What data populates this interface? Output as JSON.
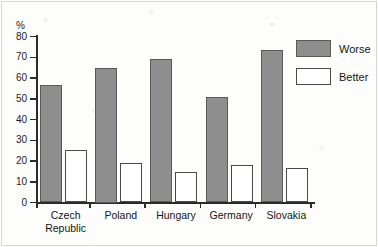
{
  "chart_data": {
    "type": "bar",
    "title": "",
    "subtitle": "",
    "xlabel": "",
    "ylabel": "%",
    "ylim": [
      0,
      80
    ],
    "ytick_labels": [
      "0",
      "10",
      "20",
      "30",
      "40",
      "50",
      "60",
      "70",
      "80"
    ],
    "ytick_values": [
      0,
      10,
      20,
      30,
      40,
      50,
      60,
      70,
      80
    ],
    "grid": false,
    "legend_position": "right-top",
    "categories": [
      "Czech Republic",
      "Poland",
      "Hungary",
      "Germany",
      "Slovakia"
    ],
    "category_lines": [
      [
        "Czech",
        "Republic"
      ],
      [
        "Poland"
      ],
      [
        "Hungary"
      ],
      [
        "Germany"
      ],
      [
        "Slovakia"
      ]
    ],
    "series": [
      {
        "name": "Worse",
        "color": "#8e8e8e",
        "border_color": "#5a5a5a",
        "values": [
          56.5,
          65,
          69,
          51,
          73.5
        ]
      },
      {
        "name": "Better",
        "color": "#ffffff",
        "border_color": "#4a4a4a",
        "values": [
          25.5,
          19,
          14.5,
          18,
          16.5
        ]
      }
    ]
  },
  "axis": {
    "unit_label": "%"
  },
  "legend": {
    "items": [
      {
        "label": "Worse",
        "swatch": "filled-gray"
      },
      {
        "label": "Better",
        "swatch": "outlined-white"
      }
    ]
  },
  "colors": {
    "worse_fill": "#8e8e8e",
    "worse_border": "#5a5a5a",
    "better_fill": "#ffffff",
    "better_border": "#4a4a4a",
    "axis": "#2b2b2b",
    "text": "#151515",
    "background": "#fdfdfc"
  }
}
